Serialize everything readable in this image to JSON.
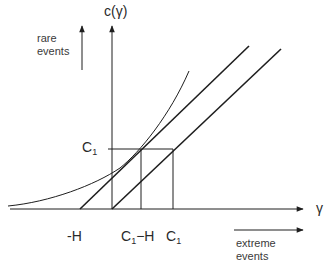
{
  "diagram": {
    "y_axis_label": "c(γ)",
    "x_axis_label": "γ",
    "y_level_label": {
      "main": "C",
      "sub": "1"
    },
    "x_ticks": [
      {
        "id": "neg-h",
        "main": "-H",
        "sub": ""
      },
      {
        "id": "c1-minus-h",
        "main": "C",
        "sub": "1",
        "suffix": "−H"
      },
      {
        "id": "c1",
        "main": "C",
        "sub": "1",
        "suffix": ""
      }
    ],
    "rare_events": {
      "line1": "rare",
      "line2": "events"
    },
    "extreme_events": {
      "line1": "extreme",
      "line2": "events"
    },
    "colors": {
      "ink": "#1e1e1e",
      "background": "#ffffff"
    }
  }
}
